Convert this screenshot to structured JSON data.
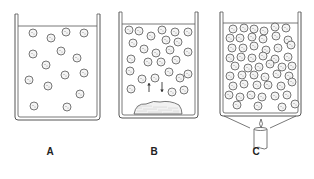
{
  "figure": {
    "width": 314,
    "height": 179,
    "colors": {
      "line": "#555555",
      "particle_fill": "#f4f4f4",
      "particle_dot": "#888888",
      "solid_fill": "#f2f2f2"
    }
  },
  "panels": [
    {
      "id": "A",
      "label": "A",
      "label_pos": [
        50,
        151
      ],
      "beaker": {
        "left": 15,
        "right": 100,
        "top": 14,
        "bottom": 120,
        "liquid_top": 26
      },
      "particles": [
        [
          33,
          33
        ],
        [
          51,
          38
        ],
        [
          66,
          32
        ],
        [
          84,
          33
        ],
        [
          33,
          54
        ],
        [
          61,
          51
        ],
        [
          77,
          58
        ],
        [
          46,
          65
        ],
        [
          65,
          75
        ],
        [
          84,
          73
        ],
        [
          29,
          80
        ],
        [
          48,
          86
        ],
        [
          80,
          94
        ],
        [
          34,
          106
        ],
        [
          67,
          107
        ]
      ],
      "solid": null,
      "arrows": []
    },
    {
      "id": "B",
      "label": "B",
      "label_pos": [
        154,
        151
      ],
      "beaker": {
        "left": 119,
        "right": 198,
        "top": 12,
        "bottom": 118,
        "liquid_top": 24
      },
      "particles": [
        [
          129,
          30
        ],
        [
          139,
          31
        ],
        [
          151,
          36
        ],
        [
          162,
          30
        ],
        [
          175,
          32
        ],
        [
          188,
          32
        ],
        [
          133,
          43
        ],
        [
          166,
          40
        ],
        [
          178,
          42
        ],
        [
          144,
          49
        ],
        [
          156,
          53
        ],
        [
          170,
          50
        ],
        [
          188,
          52
        ],
        [
          131,
          59
        ],
        [
          148,
          62
        ],
        [
          161,
          62
        ],
        [
          176,
          60
        ],
        [
          130,
          71
        ],
        [
          169,
          72
        ],
        [
          188,
          74
        ],
        [
          142,
          79
        ],
        [
          155,
          78
        ],
        [
          180,
          78
        ],
        [
          131,
          89
        ],
        [
          184,
          90
        ],
        [
          172,
          92
        ]
      ],
      "solid": {
        "cx": 158,
        "cy": 113,
        "rx": 24,
        "ry": 12
      },
      "arrows": [
        {
          "x": 149,
          "y1": 92,
          "y2": 83,
          "direction": "up"
        },
        {
          "x": 162,
          "y1": 82,
          "y2": 92,
          "direction": "down"
        }
      ]
    },
    {
      "id": "C",
      "label": "C",
      "label_pos": [
        256,
        151
      ],
      "beaker": {
        "left": 220,
        "right": 301,
        "top": 12,
        "bottom": 116,
        "liquid_top": 23
      },
      "particles": [
        [
          233,
          29
        ],
        [
          244,
          28
        ],
        [
          254,
          29
        ],
        [
          264,
          31
        ],
        [
          275,
          27
        ],
        [
          286,
          28
        ],
        [
          230,
          38
        ],
        [
          240,
          38
        ],
        [
          252,
          37
        ],
        [
          263,
          39
        ],
        [
          276,
          36
        ],
        [
          288,
          40
        ],
        [
          232,
          48
        ],
        [
          243,
          48
        ],
        [
          254,
          46
        ],
        [
          266,
          50
        ],
        [
          278,
          48
        ],
        [
          291,
          45
        ],
        [
          230,
          58
        ],
        [
          241,
          57
        ],
        [
          252,
          58
        ],
        [
          263,
          56
        ],
        [
          275,
          59
        ],
        [
          288,
          57
        ],
        [
          235,
          66
        ],
        [
          248,
          68
        ],
        [
          259,
          67
        ],
        [
          270,
          64
        ],
        [
          282,
          67
        ],
        [
          292,
          66
        ],
        [
          230,
          76
        ],
        [
          242,
          75
        ],
        [
          254,
          75
        ],
        [
          265,
          77
        ],
        [
          277,
          74
        ],
        [
          289,
          76
        ],
        [
          233,
          86
        ],
        [
          244,
          84
        ],
        [
          257,
          85
        ],
        [
          268,
          85
        ],
        [
          281,
          86
        ],
        [
          292,
          82
        ],
        [
          229,
          95
        ],
        [
          240,
          97
        ],
        [
          251,
          95
        ],
        [
          262,
          97
        ],
        [
          275,
          96
        ],
        [
          287,
          95
        ],
        [
          237,
          105
        ],
        [
          258,
          106
        ],
        [
          282,
          107
        ],
        [
          295,
          104
        ]
      ],
      "solid": null,
      "arrows": [],
      "burner": {
        "funnel": {
          "top_y": 116,
          "bottom_y": 128,
          "top_left": 224,
          "top_right": 296,
          "bottom_left": 250,
          "bottom_right": 270
        },
        "flame": {
          "cx": 261,
          "cy": 125
        },
        "candle": {
          "left": 254,
          "right": 267,
          "top": 129,
          "bottom": 149
        }
      }
    }
  ]
}
